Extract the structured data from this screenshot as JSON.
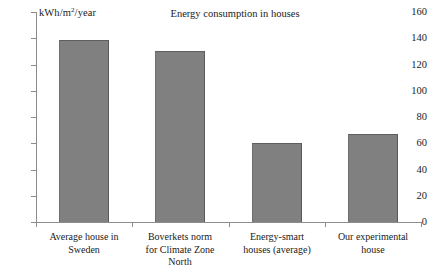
{
  "chart_data": {
    "type": "bar",
    "title": "Energy consumption in houses",
    "xlabel": "",
    "ylabel": "kWh/m2/year",
    "ylabel_display": "kWh/m",
    "ylabel_sup": "2",
    "ylabel_tail": "/year",
    "ylim": [
      0,
      160
    ],
    "ytick_step": 20,
    "yticks": [
      160,
      140,
      120,
      100,
      80,
      60,
      40,
      20,
      0
    ],
    "grid": false,
    "legend": false,
    "bar_color": "#808080",
    "axis_color": "#8c8c8c",
    "categories": [
      "Average house in Sweden",
      "Boverkets norm for Climate Zone North",
      "Energy-smart houses (average)",
      "Our experimental house"
    ],
    "category_lines": [
      [
        "Average house in",
        "Sweden"
      ],
      [
        "Boverkets norm",
        "for Climate Zone",
        "North"
      ],
      [
        "Energy-smart",
        "houses (average)"
      ],
      [
        "Our experimental",
        "house"
      ]
    ],
    "values": [
      139,
      130,
      60,
      67
    ]
  }
}
